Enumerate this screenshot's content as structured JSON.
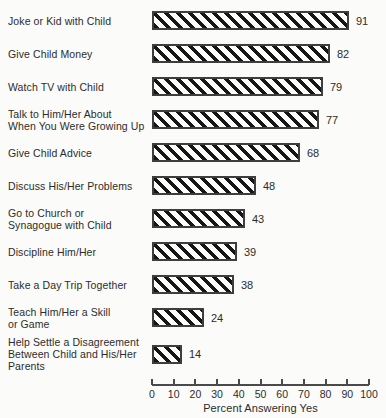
{
  "chart_data": {
    "type": "bar",
    "orientation": "horizontal",
    "title": "",
    "xlabel": "Percent Answering Yes",
    "xlim": [
      0,
      100
    ],
    "xticks": [
      0,
      10,
      20,
      30,
      40,
      50,
      60,
      70,
      80,
      90,
      100
    ],
    "grid": false,
    "legend": false,
    "bar_pattern": "diagonal-hatch",
    "categories": [
      [
        "Joke or Kid with Child"
      ],
      [
        "Give Child Money"
      ],
      [
        "Watch TV with Child"
      ],
      [
        "Talk to Him/Her About",
        "When You Were Growing Up"
      ],
      [
        "Give Child Advice"
      ],
      [
        "Discuss His/Her Problems"
      ],
      [
        "Go to Church or",
        "Synagogue with Child"
      ],
      [
        "Discipline Him/Her"
      ],
      [
        "Take a Day Trip Together"
      ],
      [
        "Teach Him/Her a Skill",
        "or Game"
      ],
      [
        "Help Settle a Disagreement",
        "Between Child and His/Her",
        "Parents"
      ]
    ],
    "values": [
      91,
      82,
      79,
      77,
      68,
      48,
      43,
      39,
      38,
      24,
      14
    ],
    "colors": {
      "stripe": "#161616",
      "bar_fill": "#fdfdfb",
      "bar_border": "#3e3e3e",
      "axis": "#4a4a4a",
      "text": "#2c2c2c",
      "background": "#fbfbf9"
    }
  }
}
